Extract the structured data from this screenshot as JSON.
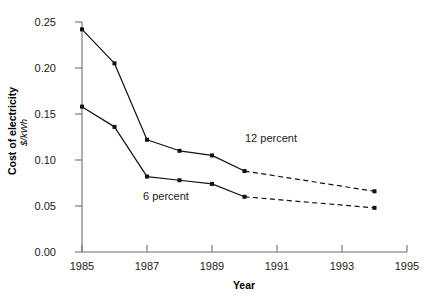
{
  "chart_data": {
    "type": "line",
    "title": "",
    "xlabel": "Year",
    "ylabel": "Cost of electricity",
    "ylabel_units": "$/kWh",
    "xlim": [
      1985,
      1995
    ],
    "ylim": [
      0.0,
      0.25
    ],
    "xticks": [
      1985,
      1987,
      1989,
      1991,
      1993,
      1995
    ],
    "xtick_labels": [
      "1985",
      "1987",
      "1989",
      "1991",
      "1993",
      "1995"
    ],
    "yticks": [
      0.0,
      0.05,
      0.1,
      0.15,
      0.2,
      0.25
    ],
    "ytick_labels": [
      "0.00",
      "0.05",
      "0.10",
      "0.15",
      "0.20",
      "0.25"
    ],
    "grid": false,
    "legend": "inline-annotations",
    "series": [
      {
        "name": "12 percent",
        "annotation": "12 percent",
        "x": [
          1985,
          1986,
          1987,
          1988,
          1989,
          1990,
          1994
        ],
        "values": [
          0.242,
          0.205,
          0.122,
          0.11,
          0.105,
          0.088,
          0.066
        ],
        "solid_through": 1990,
        "dashed_from": 1990,
        "style": "solid-then-dashed",
        "marker": "square"
      },
      {
        "name": "6 percent",
        "annotation": "6 percent",
        "x": [
          1985,
          1986,
          1987,
          1988,
          1989,
          1990,
          1994
        ],
        "values": [
          0.158,
          0.136,
          0.082,
          0.078,
          0.074,
          0.06,
          0.048
        ],
        "solid_through": 1990,
        "dashed_from": 1990,
        "style": "solid-then-dashed",
        "marker": "square"
      }
    ],
    "annotations": [
      {
        "text": "12 percent",
        "x": 1990.1,
        "y": 0.126
      },
      {
        "text": "6 percent",
        "x": 1987.4,
        "y": 0.042
      }
    ],
    "colors": {
      "line": "#111111",
      "axis": "#6f6f6f",
      "text": "#1a1a1a",
      "background": "#ffffff"
    }
  }
}
